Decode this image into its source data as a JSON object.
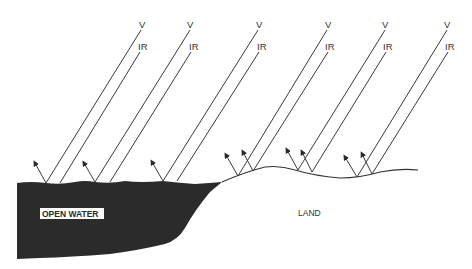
{
  "diagram": {
    "ray_labels": {
      "visible": "V",
      "infrared": "IR"
    },
    "regions": {
      "water": {
        "label": "OPEN WATER",
        "color": "#2b2b2b"
      },
      "land": {
        "label": "LAND"
      }
    },
    "ray_pairs": [
      {
        "id": 1,
        "surface": "water",
        "v_label": "V",
        "ir_label": "IR"
      },
      {
        "id": 2,
        "surface": "water",
        "v_label": "V",
        "ir_label": "IR"
      },
      {
        "id": 3,
        "surface": "water",
        "v_label": "V",
        "ir_label": "IR"
      },
      {
        "id": 4,
        "surface": "land",
        "v_label": "V",
        "ir_label": "IR"
      },
      {
        "id": 5,
        "surface": "land",
        "v_label": "V",
        "ir_label": "IR"
      },
      {
        "id": 6,
        "surface": "land",
        "v_label": "V",
        "ir_label": "IR"
      }
    ],
    "colors": {
      "line": "#3a3a3a",
      "water": "#2b2b2b",
      "background": "#ffffff"
    }
  }
}
